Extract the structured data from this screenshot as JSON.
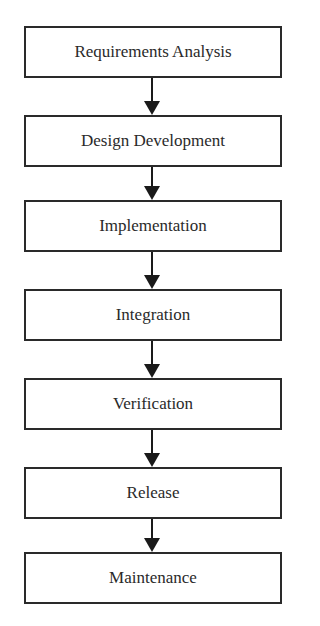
{
  "diagram": {
    "type": "flowchart",
    "direction": "top-to-bottom",
    "steps": [
      {
        "label": "Requirements Analysis"
      },
      {
        "label": "Design Development"
      },
      {
        "label": "Implementation"
      },
      {
        "label": "Integration"
      },
      {
        "label": "Verification"
      },
      {
        "label": "Release"
      },
      {
        "label": "Maintenance"
      }
    ],
    "edges": [
      {
        "from": "Requirements Analysis",
        "to": "Design Development"
      },
      {
        "from": "Design Development",
        "to": "Implementation"
      },
      {
        "from": "Implementation",
        "to": "Integration"
      },
      {
        "from": "Integration",
        "to": "Verification"
      },
      {
        "from": "Verification",
        "to": "Release"
      },
      {
        "from": "Release",
        "to": "Maintenance"
      }
    ],
    "colors": {
      "line": "#1a1a1a",
      "text": "#2a2a2a",
      "background": "#ffffff"
    }
  }
}
